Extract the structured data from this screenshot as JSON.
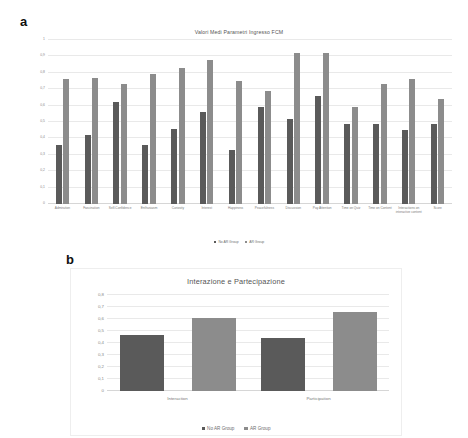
{
  "figure": {
    "panels": [
      {
        "letter": "a"
      },
      {
        "letter": "b"
      }
    ]
  },
  "legend": {
    "series": [
      {
        "name": "No AR Group",
        "color": "#5a5a5a"
      },
      {
        "name": "AR Group",
        "color": "#8c8c8c"
      }
    ]
  },
  "chart_data": [
    {
      "type": "bar",
      "panel": "a",
      "title": "Valori Medi Parametri Ingresso FCM",
      "xlabel": "",
      "ylabel": "",
      "ylim": [
        0,
        1
      ],
      "yticks": [
        "0",
        "0,1",
        "0,2",
        "0,3",
        "0,4",
        "0,5",
        "0,6",
        "0,7",
        "0,8",
        "0,9",
        "1"
      ],
      "grid": true,
      "legend_position": "bottom",
      "categories": [
        "Admiration",
        "Fascination",
        "Self-Confidence",
        "Enthusiasm",
        "Curiosity",
        "Interest",
        "Happiness",
        "Peacefulness",
        "Discussion",
        "Pay Attention",
        "Time on Quiz",
        "Time on Content",
        "Interactions on interactive content",
        "Score"
      ],
      "series": [
        {
          "name": "No AR Group",
          "color": "#5a5a5a",
          "values": [
            0.36,
            0.42,
            0.62,
            0.36,
            0.46,
            0.56,
            0.33,
            0.59,
            0.52,
            0.66,
            0.49,
            0.49,
            0.45,
            0.49
          ]
        },
        {
          "name": "AR Group",
          "color": "#8c8c8c",
          "values": [
            0.76,
            0.77,
            0.73,
            0.79,
            0.83,
            0.88,
            0.75,
            0.69,
            0.92,
            0.92,
            0.59,
            0.73,
            0.76,
            0.64
          ]
        }
      ]
    },
    {
      "type": "bar",
      "panel": "b",
      "title": "Interazione e Partecipazione",
      "xlabel": "",
      "ylabel": "",
      "ylim": [
        0,
        0.8
      ],
      "yticks": [
        "0",
        "0,1",
        "0,2",
        "0,3",
        "0,4",
        "0,5",
        "0,6",
        "0,7",
        "0,8"
      ],
      "grid": true,
      "legend_position": "bottom",
      "categories": [
        "Interaction",
        "Participation"
      ],
      "series": [
        {
          "name": "No AR Group",
          "color": "#5a5a5a",
          "values": [
            0.47,
            0.44
          ]
        },
        {
          "name": "AR Group",
          "color": "#8c8c8c",
          "values": [
            0.61,
            0.66
          ]
        }
      ]
    }
  ]
}
